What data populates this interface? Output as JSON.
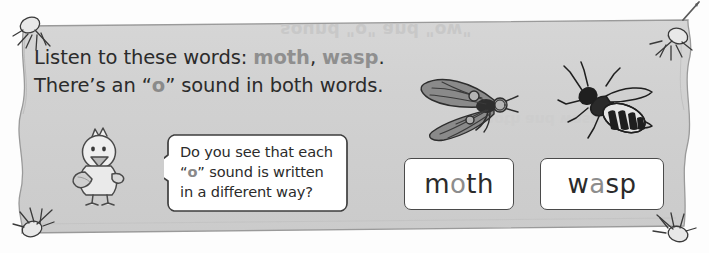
{
  "page": {
    "background_color": "#fdfdfd",
    "paper_color": "#d0d0d0",
    "ink_color": "#2b2b2b",
    "highlight_color": "#8a8a8a",
    "card_border_color": "#4a4a4a"
  },
  "bleedthrough": {
    "top_line": "sound \"o\" and \"ow\"",
    "lower_line": "moth and wasp"
  },
  "instructions": {
    "line1_part1": "Listen to these words: ",
    "line1_word1": "moth",
    "line1_sep": ", ",
    "line1_word2": "wasp",
    "line1_end": ".",
    "line2_part1": "There’s an “",
    "line2_highlight": "o",
    "line2_part2": "” sound in both words."
  },
  "speech_bubble": {
    "line1": "Do you see that each",
    "line2_pre": "“",
    "line2_highlight": "o",
    "line2_post": "” sound is written",
    "line3": "in a different way?"
  },
  "word_cards": [
    {
      "name": "moth",
      "pre": "m",
      "highlight": "o",
      "post": "th"
    },
    {
      "name": "wasp",
      "pre": "w",
      "highlight": "a",
      "post": "sp"
    }
  ],
  "illustrations": [
    {
      "label": "moth",
      "icon": "moth-icon"
    },
    {
      "label": "wasp",
      "icon": "wasp-icon"
    }
  ],
  "pushpins": [
    {
      "position": "top-left"
    },
    {
      "position": "top-right"
    },
    {
      "position": "bottom-left"
    },
    {
      "position": "bottom-right"
    }
  ],
  "character": {
    "icon": "chick-icon",
    "label": "cartoon chick"
  }
}
